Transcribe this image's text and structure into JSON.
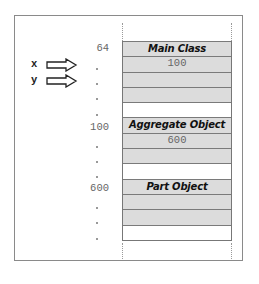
{
  "diagram": {
    "variables": [
      {
        "name": "x",
        "points_to_row": 1
      },
      {
        "name": "y",
        "points_to_row": 2
      }
    ],
    "addresses": [
      {
        "row": 0,
        "label": "64"
      },
      {
        "row": 1,
        "label": "."
      },
      {
        "row": 2,
        "label": "."
      },
      {
        "row": 3,
        "label": "."
      },
      {
        "row": 4,
        "label": "."
      },
      {
        "row": 5,
        "label": "100"
      },
      {
        "row": 6,
        "label": "."
      },
      {
        "row": 7,
        "label": "."
      },
      {
        "row": 8,
        "label": "."
      },
      {
        "row": 9,
        "label": "600"
      },
      {
        "row": 10,
        "label": "."
      },
      {
        "row": 11,
        "label": "."
      },
      {
        "row": 12,
        "label": "."
      }
    ],
    "memory": [
      {
        "text": "Main Class",
        "kind": "header",
        "fill": "gray"
      },
      {
        "text": "100",
        "kind": "value",
        "fill": "gray"
      },
      {
        "text": "",
        "kind": "value",
        "fill": "gray"
      },
      {
        "text": "",
        "kind": "value",
        "fill": "gray"
      },
      {
        "text": "",
        "kind": "value",
        "fill": "white"
      },
      {
        "text": "Aggregate Object",
        "kind": "header",
        "fill": "gray"
      },
      {
        "text": "600",
        "kind": "value",
        "fill": "gray"
      },
      {
        "text": "",
        "kind": "value",
        "fill": "gray"
      },
      {
        "text": "",
        "kind": "value",
        "fill": "white"
      },
      {
        "text": "Part Object",
        "kind": "header",
        "fill": "gray"
      },
      {
        "text": "",
        "kind": "value",
        "fill": "gray"
      },
      {
        "text": "",
        "kind": "value",
        "fill": "gray"
      },
      {
        "text": "",
        "kind": "value",
        "fill": "white"
      }
    ],
    "colors": {
      "cell_gray": "#dcdcdc",
      "cell_white": "#ffffff",
      "border": "#7a7a7a",
      "frame": "#8a8a8a"
    }
  }
}
